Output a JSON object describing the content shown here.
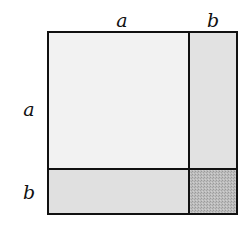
{
  "diagram": {
    "type": "area-model",
    "labels": {
      "top_a": "a",
      "top_b": "b",
      "left_a": "a",
      "left_b": "b"
    },
    "regions": [
      {
        "name": "a-squared",
        "color": "#f2f2f2"
      },
      {
        "name": "a-times-b-right",
        "color": "#e2e2e2"
      },
      {
        "name": "a-times-b-bottom",
        "color": "#e2e2e2"
      },
      {
        "name": "b-squared",
        "color": "#b9b9b9"
      }
    ],
    "stroke_color": "#111111"
  }
}
